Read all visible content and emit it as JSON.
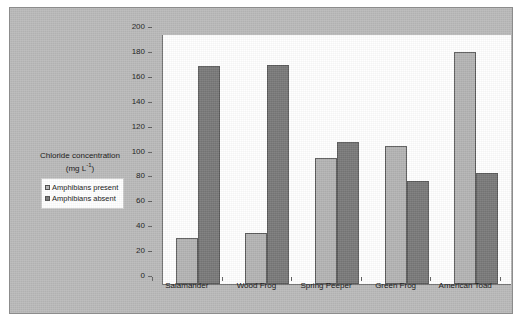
{
  "chart_data": {
    "type": "bar",
    "title": "",
    "xlabel": "",
    "ylabel": "Chloride concentration (mg L-1)",
    "ylabel_main": "Chloride concentration",
    "ylabel_units": "(mg L",
    "ylabel_units_sup": "-1",
    "ylabel_units_end": ")",
    "categories": [
      "Salamander",
      "Wood Frog",
      "Spring Peeper",
      "Green Frog",
      "American Toad"
    ],
    "series": [
      {
        "name": "Amphibians present",
        "color": "#b3b3b3",
        "values": [
          37,
          41,
          101,
          111,
          186
        ]
      },
      {
        "name": "Amphibians absent",
        "color": "#787878",
        "values": [
          175,
          176,
          114,
          83,
          89
        ]
      }
    ],
    "ylim": [
      0,
      200
    ],
    "yticks": [
      0,
      20,
      40,
      60,
      80,
      100,
      120,
      140,
      160,
      180,
      200
    ],
    "ytick_labels": [
      "0",
      "20",
      "40",
      "60",
      "80",
      "100",
      "120",
      "140",
      "160",
      "180",
      "200"
    ],
    "grid": false,
    "legend_position": "left-middle",
    "plot_background": "#ffffff",
    "panel_background": "#b9b9b9",
    "axis_color": "#6d6d6d"
  },
  "legend": {
    "items": [
      {
        "label": "Amphibians present",
        "color": "#b3b3b3"
      },
      {
        "label": "Amphibians absent",
        "color": "#787878"
      }
    ]
  }
}
